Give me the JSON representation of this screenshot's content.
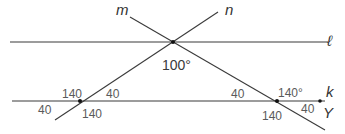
{
  "diagram": {
    "lines": {
      "l": {
        "label": "ℓ",
        "y": 42,
        "x1": 10,
        "x2": 328
      },
      "k": {
        "label": "k",
        "y": 101,
        "x1": 12,
        "x2": 325
      },
      "m": {
        "label": "m",
        "x1": 130,
        "y1": 17,
        "x2": 325,
        "y2": 130
      },
      "n": {
        "label": "n",
        "x1": 55,
        "y1": 120,
        "x2": 218,
        "y2": 12
      }
    },
    "points": {
      "top_intersection": {
        "x": 173,
        "y": 42
      },
      "left_intersection": {
        "x": 80,
        "y": 101
      },
      "right_intersection": {
        "x": 277,
        "y": 101
      },
      "Y": {
        "label": "Y",
        "x": 320,
        "y": 101
      }
    },
    "angles": {
      "top_vertex": "100°",
      "left_upper_left": "140",
      "left_upper_right": "40",
      "left_lower_left": "40",
      "left_lower_right": "140",
      "right_upper_left": "40",
      "right_upper_right": "140°",
      "right_lower_left": "140",
      "right_lower_right": "40"
    },
    "colors": {
      "line": "#3a3a3a",
      "angle_label": "#5a5a5a",
      "point": "#111111"
    }
  }
}
